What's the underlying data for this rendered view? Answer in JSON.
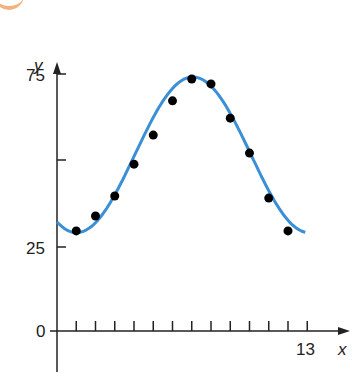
{
  "chart_data": {
    "type": "scatter",
    "title": "",
    "xlabel": "x",
    "ylabel": "y",
    "xlim": [
      0,
      13
    ],
    "ylim": [
      0,
      75
    ],
    "grid": false,
    "x_ticks": [
      1,
      2,
      3,
      4,
      5,
      6,
      7,
      8,
      9,
      10,
      11,
      12,
      13
    ],
    "x_tick_labels": {
      "13": "13"
    },
    "y_ticks": [
      25,
      50,
      75
    ],
    "y_tick_labels": {
      "0": "0",
      "25": "25",
      "75": "75"
    },
    "series": [
      {
        "name": "data points",
        "kind": "scatter",
        "color": "#000000",
        "x": [
          1,
          2,
          3,
          4,
          5,
          6,
          7,
          8,
          9,
          10,
          11,
          12
        ],
        "y": [
          29.5,
          33.8,
          39.6,
          48.8,
          57.2,
          67.1,
          73.4,
          72.0,
          62.1,
          52.0,
          39.0,
          29.5
        ]
      },
      {
        "name": "sinusoidal fit",
        "kind": "line",
        "color": "#3a8fd6",
        "x_range": [
          0,
          12.9
        ],
        "approx_equation": "y = 51.5 + 22.5 sin(0.52x - 2.1)"
      }
    ]
  },
  "labels": {
    "y_axis": "y",
    "x_axis": "x",
    "y75": "75",
    "y25": "25",
    "origin": "0",
    "x13": "13"
  }
}
